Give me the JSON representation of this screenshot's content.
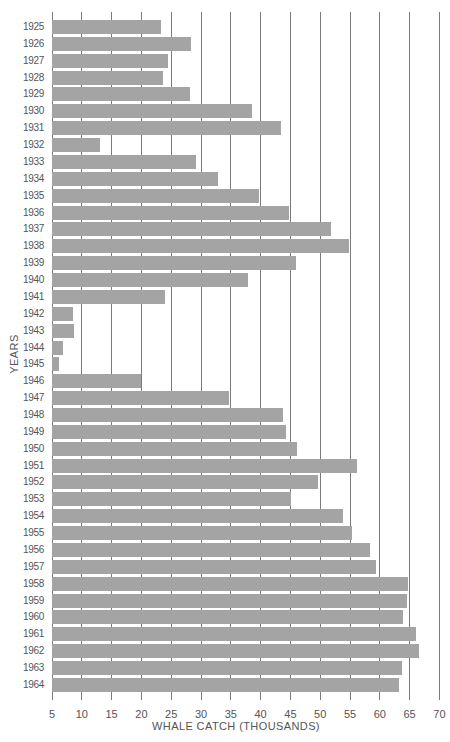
{
  "chart_data": {
    "type": "bar",
    "orientation": "horizontal",
    "title": "",
    "xlabel": "WHALE CATCH (THOUSANDS)",
    "ylabel": "YEARS",
    "xlim": [
      5,
      70
    ],
    "x_ticks": [
      5,
      10,
      15,
      20,
      25,
      30,
      35,
      40,
      45,
      50,
      55,
      60,
      65,
      70
    ],
    "grid": true,
    "colors": {
      "bar": "#a4a4a4",
      "grid": "#7a7a7a",
      "text": "#555555"
    },
    "categories": [
      "1925",
      "1926",
      "1927",
      "1928",
      "1929",
      "1930",
      "1931",
      "1932",
      "1933",
      "1934",
      "1935",
      "1936",
      "1937",
      "1938",
      "1939",
      "1940",
      "1941",
      "1942",
      "1943",
      "1944",
      "1945",
      "1946",
      "1947",
      "1948",
      "1949",
      "1950",
      "1951",
      "1952",
      "1953",
      "1954",
      "1955",
      "1956",
      "1957",
      "1958",
      "1959",
      "1960",
      "1961",
      "1962",
      "1963",
      "1964"
    ],
    "values": [
      23.3,
      28.4,
      24.4,
      23.6,
      28.1,
      38.5,
      43.4,
      13.0,
      29.1,
      32.8,
      39.7,
      44.8,
      51.8,
      54.9,
      45.9,
      37.9,
      23.9,
      8.5,
      8.7,
      6.9,
      6.2,
      19.9,
      34.7,
      43.8,
      44.3,
      46.1,
      56.1,
      49.7,
      45.1,
      53.8,
      55.4,
      58.3,
      59.4,
      64.7,
      64.6,
      63.9,
      66.0,
      66.6,
      63.7,
      63.3
    ]
  }
}
